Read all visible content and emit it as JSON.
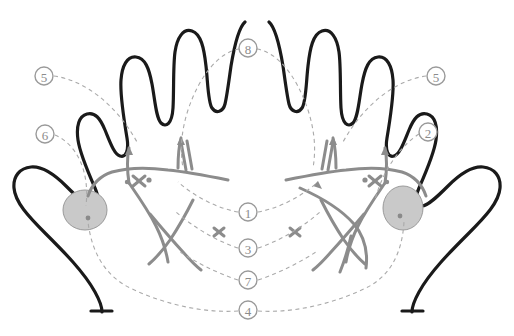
{
  "figure": {
    "background_color": "#ffffff",
    "outline_color": "#1a1a1a",
    "marking_color": "#8c8c8c",
    "leader_color": "#a8a8a8",
    "shade_fill": "#c9c9c9",
    "shade_stroke": "#9a9a9a"
  },
  "callouts": [
    {
      "id": "callout-5-left",
      "label": "5",
      "cx": 44,
      "cy": 76,
      "r": 9
    },
    {
      "id": "callout-8-top",
      "label": "8",
      "cx": 248,
      "cy": 48,
      "r": 9
    },
    {
      "id": "callout-5-right",
      "label": "5",
      "cx": 436,
      "cy": 76,
      "r": 9
    },
    {
      "id": "callout-6-left",
      "label": "6",
      "cx": 45,
      "cy": 134,
      "r": 9
    },
    {
      "id": "callout-2-right",
      "label": "2",
      "cx": 428,
      "cy": 132,
      "r": 9
    },
    {
      "id": "callout-1",
      "label": "1",
      "cx": 248,
      "cy": 212,
      "r": 9
    },
    {
      "id": "callout-3",
      "label": "3",
      "cx": 248,
      "cy": 248,
      "r": 9
    },
    {
      "id": "callout-7",
      "label": "7",
      "cx": 248,
      "cy": 280,
      "r": 9
    },
    {
      "id": "callout-4",
      "label": "4",
      "cx": 248,
      "cy": 310,
      "r": 9
    }
  ],
  "shaded_regions": [
    {
      "id": "thenar-shade-left",
      "cx": 85,
      "cy": 210,
      "rx": 22,
      "ry": 20,
      "dot_x": 88,
      "dot_y": 218
    },
    {
      "id": "thenar-shade-right",
      "cx": 403,
      "cy": 208,
      "rx": 20,
      "ry": 22,
      "dot_x": 400,
      "dot_y": 216
    }
  ],
  "hands": [
    {
      "id": "left-hand",
      "side": "left"
    },
    {
      "id": "right-hand",
      "side": "right"
    }
  ]
}
